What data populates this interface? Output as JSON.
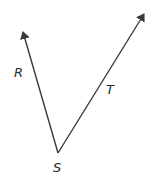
{
  "diagram": {
    "type": "angle",
    "colors": {
      "line": "#3a3a3a",
      "label": "#2a2a2a",
      "background": "#ffffff"
    },
    "vertex": {
      "label": "S",
      "x": 58,
      "y": 153
    },
    "rays": [
      {
        "name": "ray-SR",
        "label": "R",
        "tip": {
          "x": 23,
          "y": 32
        },
        "label_pos": {
          "x": 14,
          "y": 77
        }
      },
      {
        "name": "ray-ST",
        "label": "T",
        "tip": {
          "x": 144,
          "y": 14
        },
        "label_pos": {
          "x": 106,
          "y": 94
        }
      }
    ],
    "labels": {
      "R": "R",
      "S": "S",
      "T": "T"
    }
  }
}
